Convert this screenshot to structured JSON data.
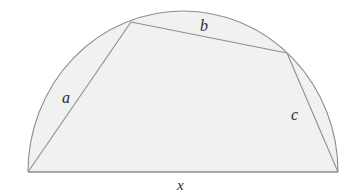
{
  "figure": {
    "type": "geometry-diagram",
    "labels": {
      "side_a": "a",
      "side_b": "b",
      "side_c": "c",
      "diameter_x": "x"
    },
    "colors": {
      "background": "#ffffff",
      "fill": "#f1f1f1",
      "stroke": "#8e8e8e",
      "baseline_stroke": "#8e8e8e",
      "label_text": "#2b2b2b"
    },
    "geometry": {
      "semicircle": {
        "center_x": 183,
        "center_y": 172,
        "radius_x": 155,
        "radius_y": 161,
        "baseline_y": 172,
        "left_end_x": 28,
        "right_end_x": 338,
        "apex_y": 11
      },
      "vertices": {
        "bottom_left": [
          28,
          172
        ],
        "upper_left": [
          131,
          22
        ],
        "upper_right": [
          287,
          53
        ],
        "bottom_right": [
          338,
          172
        ]
      },
      "sides": [
        {
          "name": "a",
          "from": "bottom_left",
          "to": "upper_left"
        },
        {
          "name": "b",
          "from": "upper_left",
          "to": "upper_right"
        },
        {
          "name": "c",
          "from": "upper_right",
          "to": "bottom_right"
        },
        {
          "name": "x",
          "from": "bottom_left",
          "to": "bottom_right"
        }
      ],
      "fill_path": "M 28 172 L 131 22 L 287 53 L 338 172 Z",
      "arc_path": "M 28 172 A 155 161 0 0 1 338 172"
    }
  }
}
